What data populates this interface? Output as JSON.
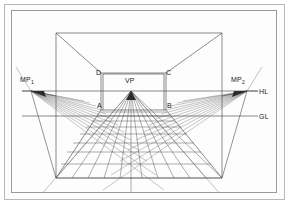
{
  "diagram": {
    "type": "perspective-grid",
    "background": "#fdfdfd",
    "line_color": "#4a4a4a",
    "frame_color": "#b9b9b9",
    "labels": {
      "mp_left": "MP",
      "mp_left_sub": "1",
      "mp_right": "MP",
      "mp_right_sub": "2",
      "vanishing_point": "VP",
      "horizon_line": "HL",
      "ground_line": "GL",
      "corner_a": "A",
      "corner_b": "B",
      "corner_c": "C",
      "corner_d": "D"
    },
    "geometry": {
      "horizon_y": 91,
      "ground_y": 116,
      "vp": [
        131,
        91
      ],
      "mp_left": [
        31,
        91
      ],
      "mp_right": [
        247,
        91
      ],
      "back_wall": {
        "x0": 101,
        "y0": 73,
        "x1": 166,
        "y1": 110
      },
      "room_near": {
        "x0": 56,
        "y0": 33,
        "x1": 222,
        "y1": 178
      },
      "grid_columns": 10,
      "grid_rows": 9
    }
  }
}
